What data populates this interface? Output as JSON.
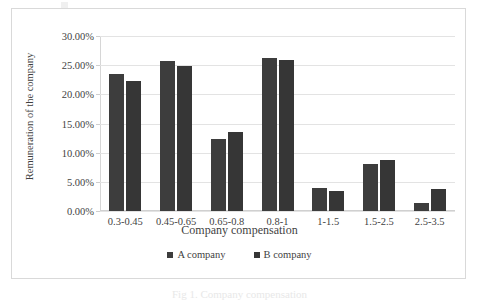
{
  "chart_data": {
    "type": "bar",
    "title": "",
    "xlabel": "Company compensation",
    "ylabel": "Remuneration of the company",
    "categories": [
      "0.3-0.45",
      "0.45-0.65",
      "0.65-0.8",
      "0.8-1",
      "1-1.5",
      "1.5-2.5",
      "2.5-3.5"
    ],
    "series": [
      {
        "name": "A company",
        "color": "#3d3d3d",
        "values": [
          23.5,
          25.7,
          12.4,
          26.2,
          4.0,
          8.0,
          1.3
        ]
      },
      {
        "name": "B company",
        "color": "#363636",
        "values": [
          22.3,
          24.9,
          13.6,
          25.9,
          3.4,
          8.7,
          3.8
        ]
      }
    ],
    "ylim": [
      0,
      30
    ],
    "ytick_values": [
      0,
      5,
      10,
      15,
      20,
      25,
      30
    ],
    "ytick_labels": [
      "0.00%",
      "5.00%",
      "10.00%",
      "15.00%",
      "20.00%",
      "25.00%",
      "30.00%"
    ],
    "grid": true,
    "legend_position": "bottom"
  },
  "caption": "Fig 1. Company compensation"
}
